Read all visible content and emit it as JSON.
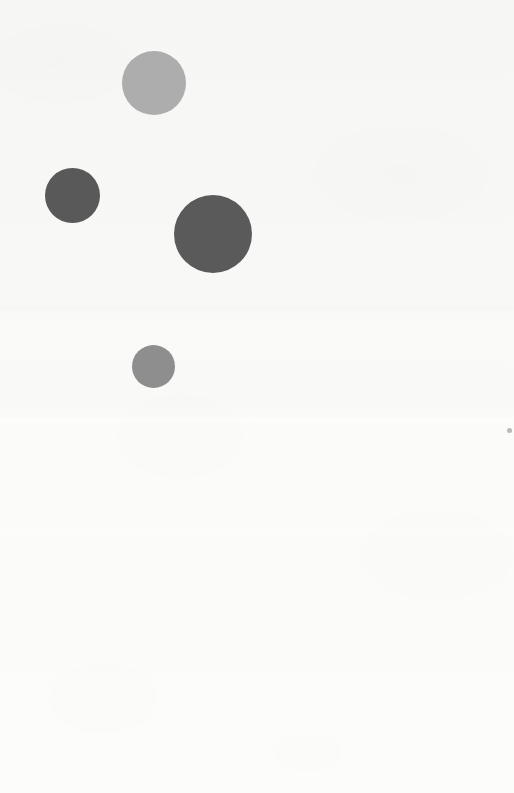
{
  "figure": {
    "background_color": "#f8f8f6",
    "width": 514,
    "height": 793
  },
  "chart_data": {
    "type": "scatter",
    "title": "",
    "subtitle": "",
    "xlabel": "",
    "ylabel": "",
    "xlim": [
      0,
      514
    ],
    "ylim": [
      0,
      793
    ],
    "grid": false,
    "legend": null,
    "axes_visible": false,
    "tick_labels_visible": false,
    "annotations": [],
    "note": "Unlabeled bubble scatter: four filled gray circles on a near-white background. Positions given in pixel coordinates with origin at top-left.",
    "points": [
      {
        "id": "bubble-1",
        "label": "",
        "x": 154,
        "y": 83,
        "diameter": 64,
        "radius": 32,
        "color": "#adadad",
        "shade": "light gray"
      },
      {
        "id": "bubble-2",
        "label": "",
        "x": 72,
        "y": 195,
        "diameter": 55,
        "radius": 27.5,
        "color": "#595959",
        "shade": "dark gray"
      },
      {
        "id": "bubble-3",
        "label": "",
        "x": 213,
        "y": 234,
        "diameter": 78,
        "radius": 39,
        "color": "#5a5a5a",
        "shade": "dark gray"
      },
      {
        "id": "bubble-4",
        "label": "",
        "x": 153,
        "y": 366,
        "diameter": 43,
        "radius": 21.5,
        "color": "#8e8e8e",
        "shade": "medium gray"
      }
    ],
    "marks": [
      {
        "id": "speck-1",
        "label": "",
        "x": 509,
        "y": 430,
        "diameter": 5,
        "color": "#b9b9b9",
        "shade": "faint gray speck at right edge"
      }
    ]
  }
}
